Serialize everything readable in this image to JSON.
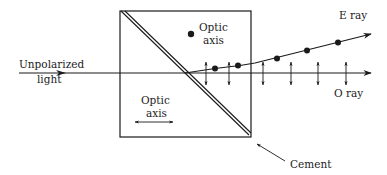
{
  "diagram": {
    "labels": {
      "input": [
        "Unpolarized",
        "light"
      ],
      "optic_axis_top": [
        "Optic",
        "axis"
      ],
      "optic_axis_bottom": [
        "Optic",
        "axis"
      ],
      "e_ray": "E ray",
      "o_ray": "O ray",
      "cement": "Cement"
    },
    "colors": {
      "line": "#1a1a1a",
      "background": "#ffffff"
    },
    "e_ray_dots": [
      [
        215,
        68
      ],
      [
        238,
        66
      ],
      [
        277,
        59
      ],
      [
        307,
        50
      ],
      [
        338,
        42
      ]
    ],
    "o_ray_double_arrows_x": [
      206,
      229,
      263,
      291,
      318,
      346
    ]
  }
}
